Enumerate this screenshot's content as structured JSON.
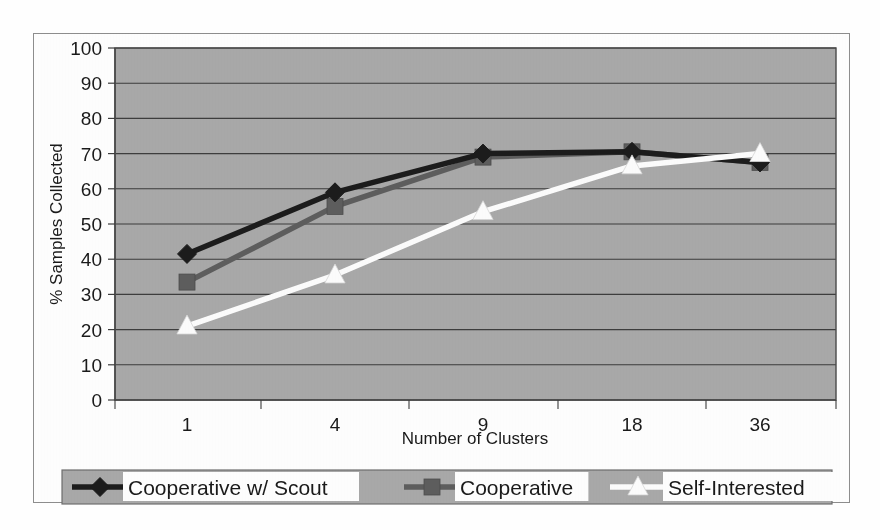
{
  "chart_data": {
    "type": "line",
    "title": "",
    "subtitle": "",
    "xlabel": "Number of Clusters",
    "ylabel": "% Samples Collected",
    "categories": [
      "1",
      "4",
      "9",
      "18",
      "36"
    ],
    "x_tick_labels": [
      "1",
      "4",
      "9",
      "18",
      "36"
    ],
    "y_tick_labels": [
      "0",
      "10",
      "20",
      "30",
      "40",
      "50",
      "60",
      "70",
      "80",
      "90",
      "100"
    ],
    "ylim": [
      0,
      100
    ],
    "y_tick_step": 10,
    "grid": "horizontal",
    "legend_position": "bottom",
    "plot_background": "#a8a8a8",
    "series": [
      {
        "name": "Cooperative w/ Scout",
        "marker": "diamond",
        "color": "#1c1c1c",
        "values": [
          41.5,
          59.0,
          70.0,
          70.5,
          67.5
        ]
      },
      {
        "name": "Cooperative",
        "marker": "square",
        "color": "#5e5e5e",
        "values": [
          33.5,
          55.0,
          69.0,
          70.5,
          67.5
        ]
      },
      {
        "name": "Self-Interested",
        "marker": "triangle",
        "color": "#fdfdfd",
        "values": [
          21.0,
          35.5,
          53.5,
          66.5,
          70.0
        ]
      }
    ]
  },
  "legend": {
    "entries": [
      {
        "label": "Cooperative w/ Scout",
        "marker": "diamond-marker",
        "color": "#1c1c1c"
      },
      {
        "label": "Cooperative",
        "marker": "square-marker",
        "color": "#5e5e5e"
      },
      {
        "label": "Self-Interested",
        "marker": "triangle-marker",
        "color": "#fdfdfd"
      }
    ]
  },
  "axes": {
    "x_title": "Number of Clusters",
    "y_title": "% Samples Collected",
    "y_ticks": [
      "100",
      "90",
      "80",
      "70",
      "60",
      "50",
      "40",
      "30",
      "20",
      "10",
      "0"
    ],
    "x_ticks": [
      "1",
      "4",
      "9",
      "18",
      "36"
    ]
  }
}
